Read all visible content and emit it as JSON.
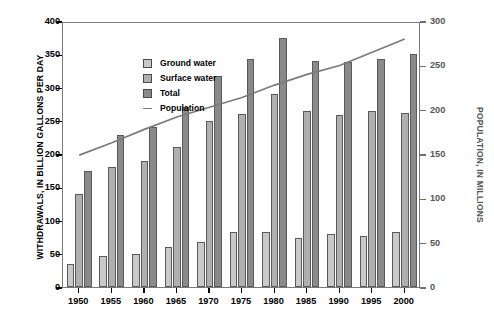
{
  "chart_data": {
    "type": "bar",
    "title": "",
    "subtitle": "",
    "categories": [
      "1950",
      "1955",
      "1960",
      "1965",
      "1970",
      "1975",
      "1980",
      "1985",
      "1990",
      "1995",
      "2000"
    ],
    "xlabel": "",
    "ylabel": "WITHDRAWALS, IN BILLION GALLONS PER DAY",
    "ylabel_right": "POPULATION, IN MILLIONS",
    "ylim": [
      0,
      400
    ],
    "ylim_right": [
      0,
      300
    ],
    "yticks": [
      0,
      50,
      100,
      150,
      200,
      250,
      300,
      350,
      400
    ],
    "yticks_right": [
      0,
      50,
      100,
      150,
      200,
      250,
      300
    ],
    "grid": false,
    "legend_position": "upper-left",
    "series": [
      {
        "name": "Ground water",
        "kind": "bar",
        "axis": "left",
        "color": "#c9c9c9",
        "values": [
          34,
          47,
          50,
          60,
          68,
          82,
          83,
          73,
          79,
          77,
          83
        ]
      },
      {
        "name": "Surface water",
        "kind": "bar",
        "axis": "left",
        "color": "#b0b0b0",
        "values": [
          140,
          180,
          190,
          210,
          250,
          260,
          290,
          265,
          259,
          264,
          262
        ]
      },
      {
        "name": "Total",
        "kind": "bar",
        "axis": "left",
        "color": "#8a8a8a",
        "values": [
          175,
          228,
          240,
          270,
          318,
          343,
          375,
          340,
          339,
          343,
          350
        ]
      },
      {
        "name": "Population",
        "kind": "line",
        "axis": "right",
        "color": "#7b7b7b",
        "values": [
          151,
          165,
          180,
          194,
          205,
          216,
          230,
          242,
          252,
          267,
          282
        ]
      }
    ]
  },
  "legend": {
    "items": [
      {
        "label": "Ground water"
      },
      {
        "label": "Surface water"
      },
      {
        "label": "Total"
      },
      {
        "label": "Population"
      }
    ]
  }
}
